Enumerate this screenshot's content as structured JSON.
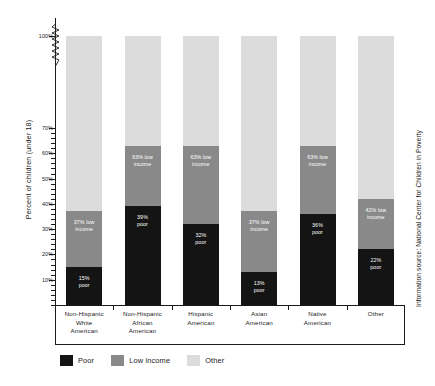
{
  "chart_data": {
    "type": "bar",
    "subtype": "stacked-bar",
    "title": "",
    "xlabel": "",
    "ylabel": "Percent of children (under 18)",
    "ylim": [
      0,
      100
    ],
    "y_axis_break": true,
    "y_axis_break_between": [
      70,
      100
    ],
    "y_tick_labels": [
      "100%",
      "70%",
      "60%",
      "50%",
      "40%",
      "30%",
      "20%",
      "10%"
    ],
    "y_tick_values": [
      100,
      70,
      60,
      50,
      40,
      30,
      20,
      10
    ],
    "grid": false,
    "legend_position": "bottom-left",
    "categories": [
      "Non-Hispanic White American",
      "Non-Hispanic African American",
      "Hispanic American",
      "Asian American",
      "Native American",
      "Other"
    ],
    "series": [
      {
        "name": "Poor",
        "color": "#141414",
        "values": [
          15,
          39,
          32,
          13,
          36,
          22
        ]
      },
      {
        "name": "Low income",
        "color": "#898989",
        "values": [
          22,
          24,
          31,
          24,
          27,
          20
        ]
      },
      {
        "name": "Other",
        "color": "#dcdcdc",
        "values": [
          63,
          37,
          37,
          63,
          37,
          58
        ]
      }
    ],
    "cumulative_low_income": [
      37,
      63,
      63,
      37,
      63,
      42
    ],
    "annotations": [
      {
        "category": "Non-Hispanic White American",
        "segment": "Low income",
        "text": "37% low income"
      },
      {
        "category": "Non-Hispanic White American",
        "segment": "Poor",
        "text": "15% poor"
      },
      {
        "category": "Non-Hispanic African American",
        "segment": "Low income",
        "text": "63% low income"
      },
      {
        "category": "Non-Hispanic African American",
        "segment": "Poor",
        "text": "39% poor"
      },
      {
        "category": "Hispanic American",
        "segment": "Low income",
        "text": "63% low income"
      },
      {
        "category": "Hispanic American",
        "segment": "Poor",
        "text": "32% poor"
      },
      {
        "category": "Asian American",
        "segment": "Low income",
        "text": "37% low income"
      },
      {
        "category": "Asian American",
        "segment": "Poor",
        "text": "13% poor"
      },
      {
        "category": "Native American",
        "segment": "Low income",
        "text": "63% low income"
      },
      {
        "category": "Native American",
        "segment": "Poor",
        "text": "36% poor"
      },
      {
        "category": "Other",
        "segment": "Low income",
        "text": "42% low income"
      },
      {
        "category": "Other",
        "segment": "Poor",
        "text": "22% poor"
      }
    ]
  },
  "axis": {
    "y_title": "Percent of children (under 18)",
    "ticks": [
      {
        "label": "100%"
      },
      {
        "label": "70%"
      },
      {
        "label": "60%"
      },
      {
        "label": "50%"
      },
      {
        "label": "40%"
      },
      {
        "label": "30%"
      },
      {
        "label": "20%"
      },
      {
        "label": "10%"
      }
    ]
  },
  "bars": [
    {
      "category_lines": [
        "Non-Hispanic",
        "White",
        "American"
      ],
      "poor_label": "15%\npoor",
      "poor_label_line1": "15%",
      "poor_label_line2": "poor",
      "low_label_line1": "37% low",
      "low_label_line2": "income",
      "poor_value": 15,
      "low_cum_value": 37
    },
    {
      "category_lines": [
        "Non-Hispanic",
        "African",
        "American"
      ],
      "poor_label_line1": "39%",
      "poor_label_line2": "poor",
      "low_label_line1": "63% low",
      "low_label_line2": "income",
      "poor_value": 39,
      "low_cum_value": 63
    },
    {
      "category_lines": [
        "Hispanic",
        "American"
      ],
      "poor_label_line1": "32%",
      "poor_label_line2": "poor",
      "low_label_line1": "63% low",
      "low_label_line2": "income",
      "poor_value": 32,
      "low_cum_value": 63
    },
    {
      "category_lines": [
        "Asian",
        "American"
      ],
      "poor_label_line1": "13%",
      "poor_label_line2": "poor",
      "low_label_line1": "37% low",
      "low_label_line2": "income",
      "poor_value": 13,
      "low_cum_value": 37
    },
    {
      "category_lines": [
        "Native",
        "American"
      ],
      "poor_label_line1": "36%",
      "poor_label_line2": "poor",
      "low_label_line1": "63% low",
      "low_label_line2": "income",
      "poor_value": 36,
      "low_cum_value": 63
    },
    {
      "category_lines": [
        "Other"
      ],
      "poor_label_line1": "22%",
      "poor_label_line2": "poor",
      "low_label_line1": "42% low",
      "low_label_line2": "income",
      "poor_value": 22,
      "low_cum_value": 42
    }
  ],
  "legend": {
    "items": [
      {
        "label": "Poor",
        "color": "#141414"
      },
      {
        "label": "Low income",
        "color": "#898989"
      },
      {
        "label": "Other",
        "color": "#dcdcdc"
      }
    ]
  },
  "source": {
    "text": "Information source: National Center for Children in Poverty"
  },
  "colors": {
    "poor": "#141414",
    "low_income": "#898989",
    "other": "#dcdcdc",
    "axis": "#1a1a1a",
    "background": "#ffffff"
  }
}
